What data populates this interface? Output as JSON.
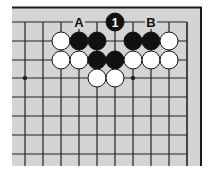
{
  "diagram": {
    "type": "go-board-problem",
    "colors": {
      "board": "#d4d4d4",
      "line": "#222222",
      "border": "#1a1a1a",
      "black_stone": "#111111",
      "white_stone": "#ffffff"
    },
    "grid": {
      "x": [
        25,
        43,
        61,
        79,
        97,
        115,
        133,
        151,
        169,
        187
      ],
      "y": [
        22,
        41,
        60,
        78,
        97,
        116,
        135,
        154
      ],
      "left_extent": 12,
      "bottom_extent": 166
    },
    "star_points": [
      {
        "col": 0,
        "row": 3
      },
      {
        "col": 6,
        "row": 3
      }
    ],
    "stones": [
      {
        "color": "black",
        "col": 5,
        "row": 0,
        "label": "1"
      },
      {
        "color": "white",
        "col": 2,
        "row": 1
      },
      {
        "color": "black",
        "col": 3,
        "row": 1
      },
      {
        "color": "black",
        "col": 4,
        "row": 1
      },
      {
        "color": "black",
        "col": 6,
        "row": 1
      },
      {
        "color": "black",
        "col": 7,
        "row": 1
      },
      {
        "color": "white",
        "col": 8,
        "row": 1
      },
      {
        "color": "white",
        "col": 2,
        "row": 2
      },
      {
        "color": "white",
        "col": 3,
        "row": 2
      },
      {
        "color": "black",
        "col": 4,
        "row": 2
      },
      {
        "color": "black",
        "col": 5,
        "row": 2
      },
      {
        "color": "white",
        "col": 6,
        "row": 2
      },
      {
        "color": "white",
        "col": 7,
        "row": 2
      },
      {
        "color": "white",
        "col": 8,
        "row": 2
      },
      {
        "color": "white",
        "col": 4,
        "row": 3
      },
      {
        "color": "white",
        "col": 5,
        "row": 3
      }
    ],
    "point_labels": [
      {
        "text": "A",
        "col": 3,
        "row": 0
      },
      {
        "text": "B",
        "col": 7,
        "row": 0
      }
    ]
  }
}
